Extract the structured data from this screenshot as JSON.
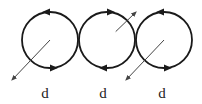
{
  "diagram": {
    "stroke_color": "#1a1a1a",
    "arrow_color": "#444444",
    "loops": [
      {
        "id": "loop-1",
        "rotation": "counterclockwise",
        "dipole_direction": "down-left",
        "label": "d"
      },
      {
        "id": "loop-2",
        "rotation": "clockwise",
        "dipole_direction": "up-right",
        "label": "d"
      },
      {
        "id": "loop-3",
        "rotation": "counterclockwise",
        "dipole_direction": "down-left",
        "label": "d"
      }
    ]
  }
}
